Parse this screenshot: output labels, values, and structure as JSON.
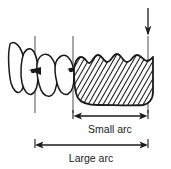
{
  "figure": {
    "background_color": "#ffffff",
    "line_color": "#1a1a1a",
    "hatch_color": "#1a1a1a"
  },
  "annotations": {
    "small_arc_label": "Small arc",
    "large_arc_label": "Large arc"
  },
  "dimensions": {
    "small_arc": {
      "label": "Small arc",
      "x_start": 73,
      "x_end": 148,
      "y": 116
    },
    "large_arc": {
      "label": "Large arc",
      "x_start": 35,
      "x_end": 148,
      "y": 145
    }
  },
  "markers": {
    "load_arrow": {
      "name": "downward-force-arrow",
      "x": 148,
      "y_start": 8,
      "y_end": 36
    },
    "reference_lines": [
      {
        "name": "reference-line-left",
        "x": 35,
        "y_start": 36,
        "y_end": 113
      },
      {
        "name": "reference-line-middle",
        "x": 73,
        "y_start": 36,
        "y_end": 113
      },
      {
        "name": "reference-line-right",
        "x": 148,
        "y_start": 36,
        "y_end": 113
      }
    ]
  },
  "shapes": {
    "hatched_span": {
      "name": "hatched-edentulous-span",
      "x_start": 73,
      "x_end": 153,
      "y_top": 55,
      "y_bottom": 106,
      "scallop_count": 5,
      "hatch_angle_deg": 60
    },
    "teeth": [
      {
        "name": "tooth-1",
        "cx": 17,
        "cy": 68
      },
      {
        "name": "tooth-2",
        "cx": 33,
        "cy": 72
      },
      {
        "name": "tooth-3",
        "cx": 50,
        "cy": 73
      },
      {
        "name": "tooth-4",
        "cx": 66,
        "cy": 72
      }
    ],
    "contact_points": [
      {
        "name": "contact-point-left",
        "cx": 35,
        "cy": 71
      },
      {
        "name": "contact-point-right",
        "cx": 72,
        "cy": 70
      }
    ]
  }
}
